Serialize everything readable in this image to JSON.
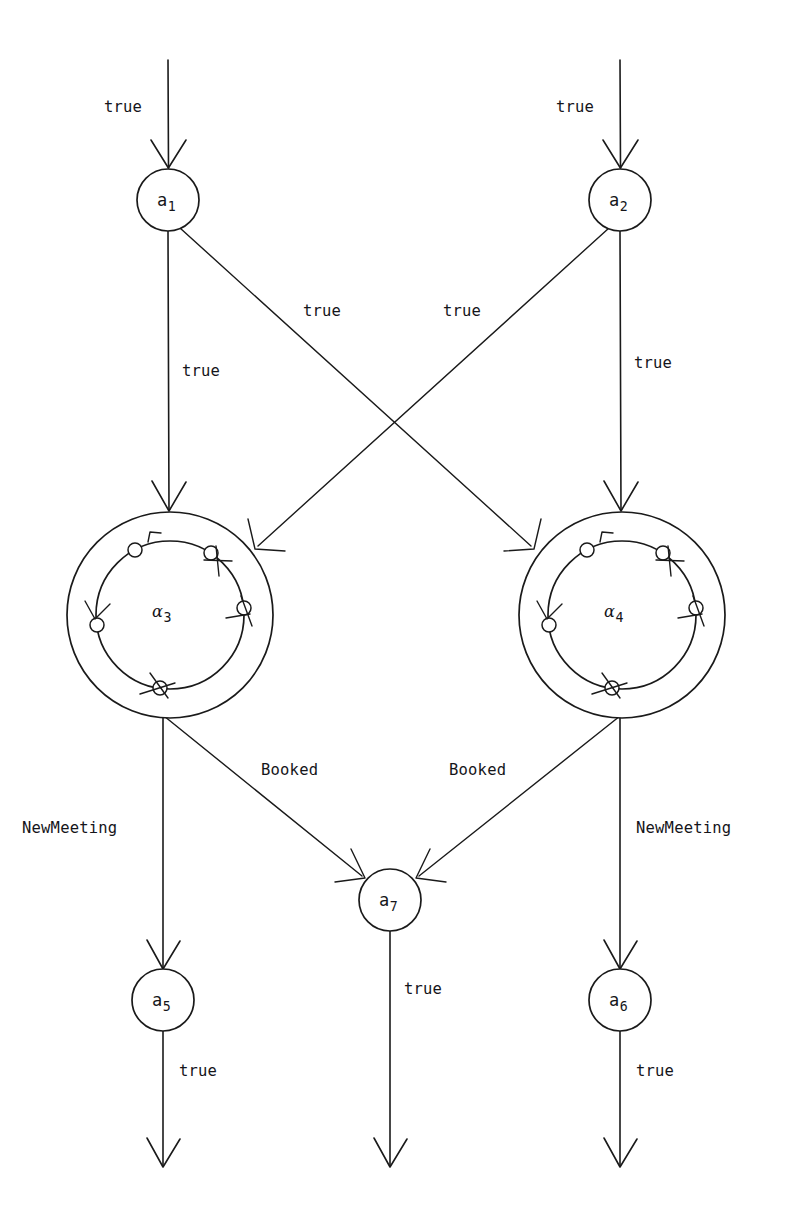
{
  "diagram": {
    "background_color": "#ffffff",
    "line_color": "#1a1a1a",
    "nodes": [
      {
        "id": "a1",
        "label_base": "a",
        "label_sub": "1",
        "kind": "simple",
        "cx": 168,
        "cy": 200,
        "r": 31
      },
      {
        "id": "a2",
        "label_base": "a",
        "label_sub": "2",
        "kind": "simple",
        "cx": 620,
        "cy": 200,
        "r": 31
      },
      {
        "id": "a3",
        "label_base": "α",
        "label_sub": "3",
        "kind": "composite",
        "cx": 170,
        "cy": 615,
        "r_outer": 103,
        "r_inner": 74
      },
      {
        "id": "a4",
        "label_base": "α",
        "label_sub": "4",
        "kind": "composite",
        "cx": 622,
        "cy": 615,
        "r_outer": 103,
        "r_inner": 74
      },
      {
        "id": "a7",
        "label_base": "a",
        "label_sub": "7",
        "kind": "simple",
        "cx": 390,
        "cy": 900,
        "r": 31
      },
      {
        "id": "a5",
        "label_base": "a",
        "label_sub": "5",
        "kind": "simple",
        "cx": 163,
        "cy": 1000,
        "r": 31
      },
      {
        "id": "a6",
        "label_base": "a",
        "label_sub": "6",
        "kind": "simple",
        "cx": 620,
        "cy": 1000,
        "r": 31
      }
    ],
    "edge_labels": [
      {
        "text": "true",
        "x": 104,
        "y": 100,
        "name": "edge-label-entry-a1"
      },
      {
        "text": "true",
        "x": 556,
        "y": 100,
        "name": "edge-label-entry-a2"
      },
      {
        "text": "true",
        "x": 182,
        "y": 364,
        "name": "edge-label-a1-a3"
      },
      {
        "text": "true",
        "x": 634,
        "y": 356,
        "name": "edge-label-a2-a4"
      },
      {
        "text": "true",
        "x": 303,
        "y": 304,
        "name": "edge-label-a1-a4"
      },
      {
        "text": "true",
        "x": 443,
        "y": 304,
        "name": "edge-label-a2-a3"
      },
      {
        "text": "Booked",
        "x": 261,
        "y": 763,
        "name": "edge-label-a3-a7"
      },
      {
        "text": "Booked",
        "x": 449,
        "y": 763,
        "name": "edge-label-a4-a7"
      },
      {
        "text": "NewMeeting",
        "x": 22,
        "y": 821,
        "name": "edge-label-a3-a5"
      },
      {
        "text": "NewMeeting",
        "x": 636,
        "y": 821,
        "name": "edge-label-a4-a6"
      },
      {
        "text": "true",
        "x": 404,
        "y": 982,
        "name": "edge-label-a7-exit"
      },
      {
        "text": "true",
        "x": 179,
        "y": 1064,
        "name": "edge-label-a5-exit"
      },
      {
        "text": "true",
        "x": 636,
        "y": 1064,
        "name": "edge-label-a6-exit"
      }
    ],
    "edges": [
      {
        "from": "entry",
        "to": "a1",
        "label": "true"
      },
      {
        "from": "entry",
        "to": "a2",
        "label": "true"
      },
      {
        "from": "a1",
        "to": "a3",
        "label": "true"
      },
      {
        "from": "a1",
        "to": "a4",
        "label": "true"
      },
      {
        "from": "a2",
        "to": "a3",
        "label": "true"
      },
      {
        "from": "a2",
        "to": "a4",
        "label": "true"
      },
      {
        "from": "a3",
        "to": "a5",
        "label": "NewMeeting"
      },
      {
        "from": "a3",
        "to": "a7",
        "label": "Booked"
      },
      {
        "from": "a4",
        "to": "a7",
        "label": "Booked"
      },
      {
        "from": "a4",
        "to": "a6",
        "label": "NewMeeting"
      },
      {
        "from": "a5",
        "to": "exit",
        "label": "true"
      },
      {
        "from": "a7",
        "to": "exit",
        "label": "true"
      },
      {
        "from": "a6",
        "to": "exit",
        "label": "true"
      }
    ],
    "substate_angles_deg": [
      118,
      56,
      188,
      354,
      268
    ]
  }
}
